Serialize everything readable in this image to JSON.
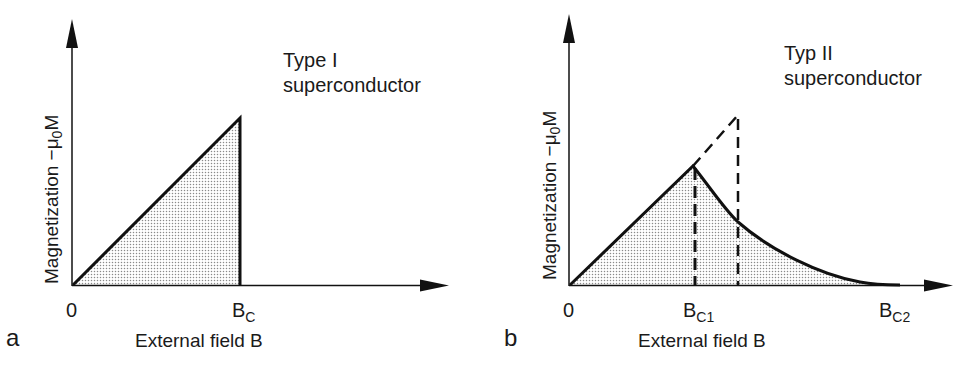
{
  "figure": {
    "panels": [
      {
        "id": "a",
        "panel_label": "a",
        "title_line1": "Type I",
        "title_line2": "superconductor",
        "y_axis_label": "Magnetization −μ",
        "y_axis_label_sub": "0",
        "y_axis_label_end": "M",
        "x_axis_label": "External field B",
        "ticks": [
          {
            "main": "0",
            "sub": ""
          },
          {
            "main": "B",
            "sub": "C"
          }
        ]
      },
      {
        "id": "b",
        "panel_label": "b",
        "title_line1": "Typ II",
        "title_line2": "superconductor",
        "y_axis_label": "Magnetization −μ",
        "y_axis_label_sub": "0",
        "y_axis_label_end": "M",
        "x_axis_label": "External field B",
        "ticks": [
          {
            "main": "0",
            "sub": ""
          },
          {
            "main": "B",
            "sub": "C1"
          },
          {
            "main": "B",
            "sub": "C2"
          }
        ]
      }
    ],
    "colors": {
      "ink": "#111111",
      "stipple": "#8a8a8a",
      "background": "#ffffff"
    }
  }
}
